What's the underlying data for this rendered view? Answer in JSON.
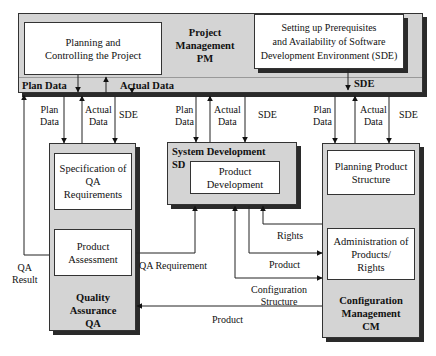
{
  "pm": {
    "title_line1": "Project",
    "title_line2": "Management",
    "title_line3": "PM",
    "planning_box": "Planning and Controlling the Project",
    "sde_box_line1": "Setting up Prerequisites",
    "sde_box_line2": "and Availability of Software",
    "sde_box_line3": "Development Environment (SDE)",
    "plan_data": "Plan Data",
    "actual_data": "Actual Data",
    "sde": "SDE"
  },
  "qa": {
    "spec_box": "Specification of QA Requirements",
    "assessment_box": "Product Assessment",
    "title_line1": "Quality",
    "title_line2": "Assurance",
    "title_line3": "QA"
  },
  "sd": {
    "title_line1": "System Development",
    "title_line2": "SD",
    "product_box": "Product Development"
  },
  "cm": {
    "planning_box": "Planning Product Structure",
    "admin_box_line1": "Administration of",
    "admin_box_line2": "Products/",
    "admin_box_line3": "Rights",
    "title_line1": "Configuration",
    "title_line2": "Management",
    "title_line3": "CM"
  },
  "flows": {
    "qa_plan_data_1": "Plan",
    "qa_plan_data_2": "Data",
    "qa_actual_data_1": "Actual",
    "qa_actual_data_2": "Data",
    "qa_sde": "SDE",
    "sd_plan_data_1": "Plan",
    "sd_plan_data_2": "Data",
    "sd_actual_data_1": "Actual",
    "sd_actual_data_2": "Data",
    "sd_sde": "SDE",
    "cm_plan_data_1": "Plan",
    "cm_plan_data_2": "Data",
    "cm_actual_data_1": "Actual",
    "cm_actual_data_2": "Data",
    "cm_sde": "SDE",
    "qa_result_1": "QA",
    "qa_result_2": "Result",
    "qa_requirement": "QA Requirement",
    "rights": "Rights",
    "product_to_cm": "Product",
    "configuration_structure_1": "Configuration",
    "configuration_structure_2": "Structure",
    "product_to_qa": "Product"
  }
}
